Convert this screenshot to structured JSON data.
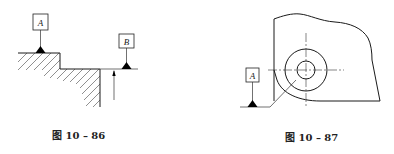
{
  "figures": [
    {
      "id": "fig-10-86",
      "caption": "图 10 – 86",
      "datums": [
        {
          "letter": "A"
        },
        {
          "letter": "B"
        }
      ]
    },
    {
      "id": "fig-10-87",
      "caption": "图 10 – 87",
      "datums": [
        {
          "letter": "A"
        }
      ]
    }
  ],
  "colors": {
    "line": "#1a1a1a",
    "background": "#ffffff"
  }
}
